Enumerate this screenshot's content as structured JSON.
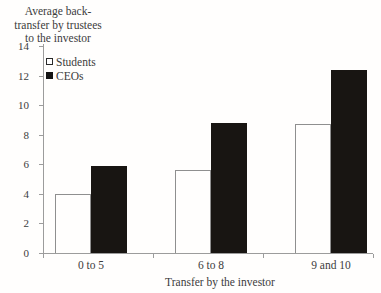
{
  "chart_data": {
    "type": "bar",
    "title_lines": [
      "Average back-",
      "transfer by trustees",
      "to the investor"
    ],
    "categories": [
      "0 to 5",
      "6 to 8",
      "9 and 10"
    ],
    "series": [
      {
        "name": "Students",
        "style": "open-white",
        "fill": "#ffffff",
        "border": "#8f8f8f",
        "values": [
          4.0,
          5.6,
          8.7
        ]
      },
      {
        "name": "CEOs",
        "style": "solid-black",
        "fill": "#181512",
        "border": "#181512",
        "values": [
          5.9,
          8.8,
          12.4
        ]
      }
    ],
    "xlabel": "Transfer by the investor",
    "ylabel": "Average back-transfer by trustees to the investor",
    "ylim": [
      0,
      14
    ],
    "ytick_step": 2,
    "yticks": [
      0,
      2,
      4,
      6,
      8,
      10,
      12,
      14
    ],
    "grid": false,
    "legend_position": "top-left-inside"
  },
  "colors": {
    "background": "#fffefd",
    "axis": "#9c9c9c",
    "text": "#3c3c3c",
    "bar_filled": "#181512",
    "bar_open_border": "#8f8f8f"
  }
}
